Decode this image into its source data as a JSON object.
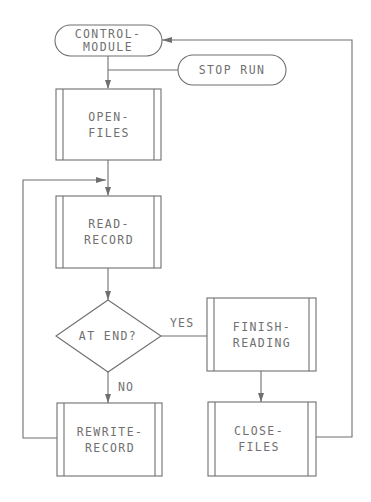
{
  "diagram": {
    "type": "flowchart",
    "colors": {
      "line": "#6f6f6f",
      "text": "#707070",
      "background": "#ffffff"
    },
    "nodes": {
      "control_module": {
        "shape": "terminal",
        "line1": "CONTROL-",
        "line2": "MODULE"
      },
      "stop_run": {
        "shape": "terminal",
        "label": "STOP RUN"
      },
      "open_files": {
        "shape": "predefined-process",
        "line1": "OPEN-",
        "line2": "FILES"
      },
      "read_record": {
        "shape": "predefined-process",
        "line1": "READ-",
        "line2": "RECORD"
      },
      "at_end": {
        "shape": "decision",
        "label": "AT END?"
      },
      "finish_reading": {
        "shape": "predefined-process",
        "line1": "FINISH-",
        "line2": "READING"
      },
      "rewrite_record": {
        "shape": "predefined-process",
        "line1": "REWRITE-",
        "line2": "RECORD"
      },
      "close_files": {
        "shape": "predefined-process",
        "line1": "CLOSE-",
        "line2": "FILES"
      }
    },
    "edge_labels": {
      "yes": "YES",
      "no": "NO"
    },
    "edges": [
      {
        "from": "control_module",
        "to": "open_files"
      },
      {
        "from": "stop_run",
        "to": "open_files-line"
      },
      {
        "from": "open_files",
        "to": "read_record"
      },
      {
        "from": "read_record",
        "to": "at_end"
      },
      {
        "from": "at_end",
        "to": "finish_reading",
        "label": "YES"
      },
      {
        "from": "at_end",
        "to": "rewrite_record",
        "label": "NO"
      },
      {
        "from": "rewrite_record",
        "to": "read_record"
      },
      {
        "from": "finish_reading",
        "to": "close_files"
      },
      {
        "from": "close_files",
        "to": "control_module"
      }
    ]
  }
}
